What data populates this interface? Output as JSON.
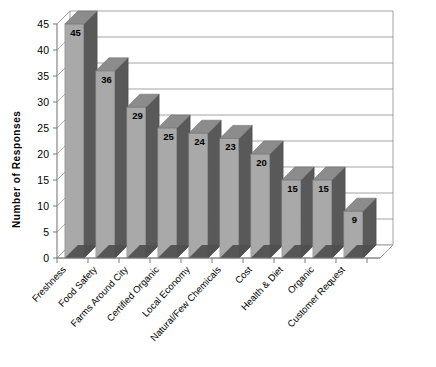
{
  "chart_data": {
    "type": "bar",
    "title": "",
    "xlabel": "",
    "ylabel": "Number of Responses",
    "ylim": [
      0,
      45
    ],
    "ytick_step": 5,
    "yticks": [
      "0",
      "5",
      "10",
      "15",
      "20",
      "25",
      "30",
      "35",
      "40",
      "45"
    ],
    "grid": true,
    "legend": "none",
    "style": "3d-column",
    "categories": [
      "Freshness",
      "Food Safety",
      "Farms Around City",
      "Certified Organic",
      "Local Economy",
      "Natural/Few Chemicals",
      "Cost",
      "Health & Diet",
      "Organic",
      "Customer Request"
    ],
    "values": [
      45,
      36,
      29,
      25,
      24,
      23,
      20,
      15,
      15,
      9
    ],
    "data_labels": [
      "45",
      "36",
      "29",
      "25",
      "24",
      "23",
      "20",
      "15",
      "15",
      "9"
    ],
    "colors": {
      "bar_front": "#a9a9a9",
      "bar_side": "#595959",
      "bar_top": "#8c8c8c",
      "floor": "#b5b5b5",
      "floor_side": "#4f4f4f",
      "gridline": "#999999",
      "axis": "#7a7a7a",
      "text": "#000000",
      "background": "#ffffff"
    }
  },
  "chart": {
    "y_axis_title": "Number of Responses"
  }
}
